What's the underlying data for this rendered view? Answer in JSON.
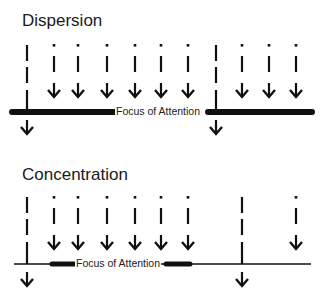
{
  "colors": {
    "ink": "#111111",
    "text": "#1a1a1a",
    "background": "#ffffff"
  },
  "panels": [
    {
      "id": "dispersion",
      "title": "Dispersion",
      "title_pos": [
        22,
        12
      ],
      "label": "Focus of Attention",
      "label_pos": [
        115,
        106
      ],
      "baseline_y": 112,
      "thin_line": null,
      "thick_segments": [
        [
          12,
          115
        ],
        [
          208,
          312
        ]
      ],
      "short_arrows_x": [
        54,
        78,
        107,
        135,
        161,
        188,
        242,
        269,
        296
      ],
      "short_arrow_top": 44,
      "long_arrows_x": [
        27,
        216
      ],
      "long_arrow_top": 45
    },
    {
      "id": "concentration",
      "title": "Concentration",
      "title_pos": [
        22,
        166
      ],
      "label": "Focus of Attention",
      "label_pos": [
        75,
        258
      ],
      "baseline_y": 264,
      "thin_line": [
        14,
        311
      ],
      "thick_segments": [
        [
          52,
          75
        ],
        [
          166,
          190
        ]
      ],
      "short_arrows_x": [
        54,
        78,
        107,
        135,
        161,
        188,
        296
      ],
      "short_arrow_top": 196,
      "long_arrows_x": [
        27,
        242
      ],
      "long_arrow_top": 197
    }
  ]
}
